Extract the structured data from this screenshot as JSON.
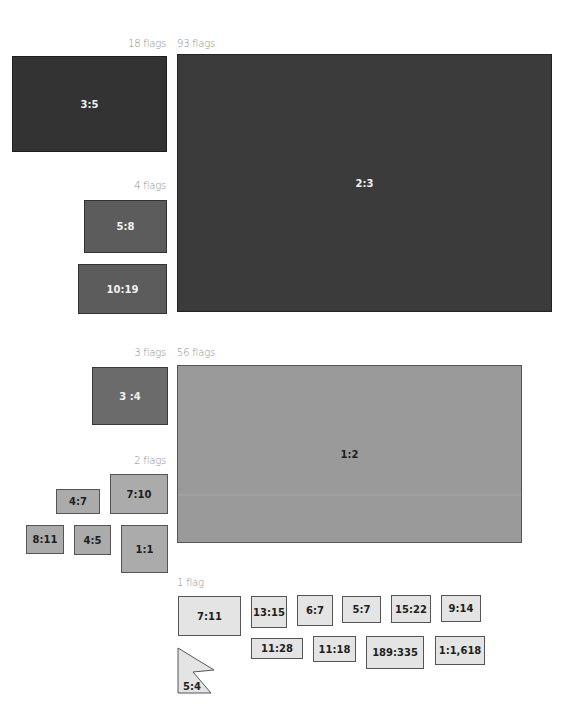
{
  "groups": [
    {
      "count_label": "18 flags",
      "shapes": [
        {
          "ratio": "3:5"
        }
      ]
    },
    {
      "count_label": "93 flags",
      "shapes": [
        {
          "ratio": "2:3"
        }
      ]
    },
    {
      "count_label": "4 flags",
      "shapes": [
        {
          "ratio": "5:8"
        },
        {
          "ratio": "10:19"
        }
      ]
    },
    {
      "count_label": "3 flags",
      "shapes": [
        {
          "ratio": "3 :4"
        }
      ]
    },
    {
      "count_label": "56 flags",
      "shapes": [
        {
          "ratio": "1:2"
        }
      ]
    },
    {
      "count_label": "2 flags",
      "shapes": [
        {
          "ratio": "4:7"
        },
        {
          "ratio": "7:10"
        },
        {
          "ratio": "8:11"
        },
        {
          "ratio": "4:5"
        },
        {
          "ratio": "1:1"
        }
      ]
    },
    {
      "count_label": "1 flag",
      "shapes": [
        {
          "ratio": "7:11"
        },
        {
          "ratio": "13:15"
        },
        {
          "ratio": "6:7"
        },
        {
          "ratio": "5:7"
        },
        {
          "ratio": "15:22"
        },
        {
          "ratio": "9:14"
        },
        {
          "ratio": "11:28"
        },
        {
          "ratio": "11:18"
        },
        {
          "ratio": "189:335"
        },
        {
          "ratio": "1:1,618"
        },
        {
          "ratio": "5:4"
        }
      ]
    }
  ],
  "colors": {
    "tier_18": "#333333",
    "tier_93": "#3b3b3b",
    "tier_4": "#5c5c5c",
    "tier_3": "#6b6b6b",
    "tier_56": "#9a9a9a",
    "tier_2": "#ababab",
    "tier_1": "#e4e4e4"
  }
}
